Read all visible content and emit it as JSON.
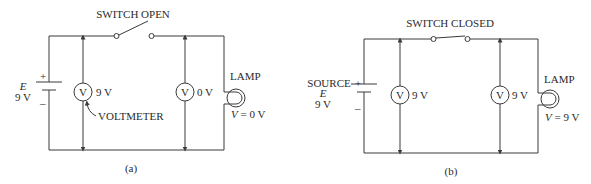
{
  "panel_a": {
    "switch_label": "SWITCH OPEN",
    "source_symbol": "E",
    "source_value": "9 V",
    "plus": "+",
    "minus": "–",
    "meter1_glyph": "V",
    "meter1_reading": "9 V",
    "meter2_glyph": "V",
    "meter2_reading": "0 V",
    "voltmeter_label": "VOLTMETER",
    "lamp_label": "LAMP",
    "lamp_v_symbol": "V",
    "lamp_v_value": " = 0 V",
    "caption": "(a)"
  },
  "panel_b": {
    "switch_label": "SWITCH CLOSED",
    "source_label": "SOURCE",
    "source_symbol": "E",
    "source_value": "9 V",
    "plus": "+",
    "minus": "–",
    "meter1_glyph": "V",
    "meter1_reading": "9 V",
    "meter2_glyph": "V",
    "meter2_reading": "9 V",
    "lamp_label": "LAMP",
    "lamp_v_symbol": "V",
    "lamp_v_value": " = 9 V",
    "caption": "(b)"
  }
}
